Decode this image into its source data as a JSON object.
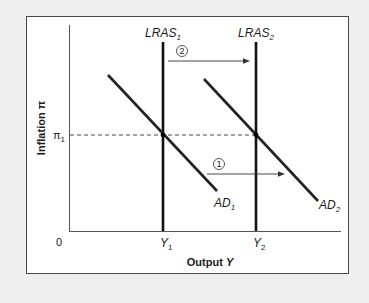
{
  "diagram": {
    "type": "AD-LRAS economics diagram",
    "axes": {
      "y_label": "Inflation π",
      "x_label_text": "Output ",
      "x_label_var": "Y",
      "origin": "0"
    },
    "ticks": {
      "pi": {
        "base": "π",
        "sub": "1"
      },
      "y1": {
        "base": "Y",
        "sub": "1"
      },
      "y2": {
        "base": "Y",
        "sub": "2"
      }
    },
    "curves": {
      "lras1": {
        "base": "LRAS",
        "sub": "1"
      },
      "lras2": {
        "base": "LRAS",
        "sub": "2"
      },
      "ad1": {
        "base": "AD",
        "sub": "1"
      },
      "ad2": {
        "base": "AD",
        "sub": "2"
      }
    },
    "annotations": {
      "step1": "1",
      "step2": "2"
    },
    "colors": {
      "background": "#efefef",
      "panel": "#ffffff",
      "frame": "#4a4a4a",
      "curve": "#1a1a1a",
      "axis": "#333333"
    }
  }
}
